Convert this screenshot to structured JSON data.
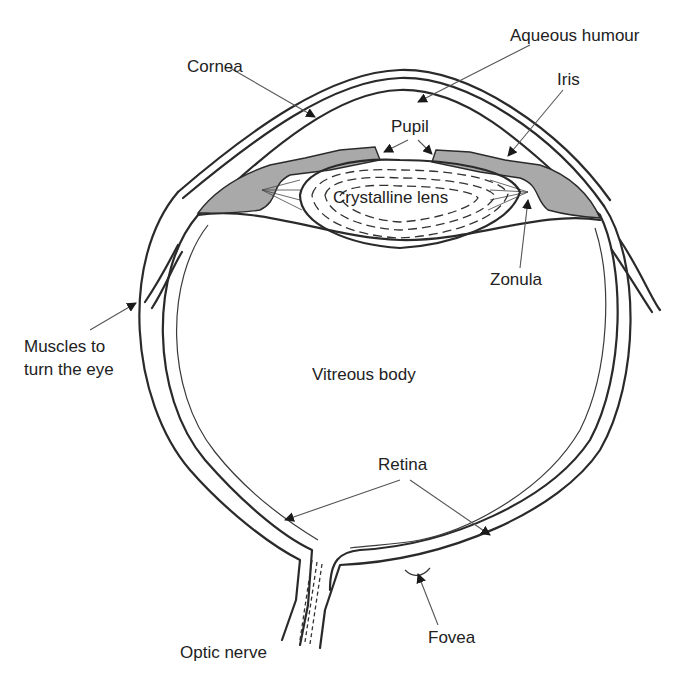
{
  "diagram": {
    "labels": {
      "aqueous_humour": "Aqueous humour",
      "cornea": "Cornea",
      "iris": "Iris",
      "pupil": "Pupil",
      "crystalline_lens": "Crystalline lens",
      "zonula": "Zonula",
      "muscles_line1": "Muscles to",
      "muscles_line2": "turn the eye",
      "vitreous_body": "Vitreous body",
      "retina": "Retina",
      "optic_nerve": "Optic nerve",
      "fovea": "Fovea"
    },
    "colors": {
      "stroke": "#2a2a2a",
      "iris_fill": "#a9a9a9",
      "background": "#ffffff"
    }
  }
}
